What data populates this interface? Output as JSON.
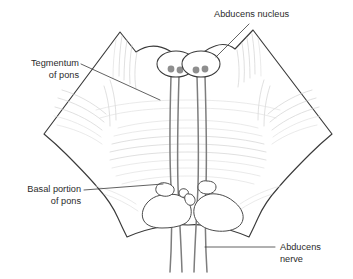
{
  "figure": {
    "background_color": "#ffffff",
    "outline_color": "#3a3a3a",
    "fiber_color": "#7d7d7d",
    "nucleus_dot_color": "#8e8e8e",
    "striation_color": "#cfcfcf",
    "text_color": "#2b2b2b"
  },
  "labels": {
    "abducens_nucleus": {
      "line1": "Abducens nucleus",
      "line2": ""
    },
    "tegmentum_of_pons": {
      "line1": "Tegmentum",
      "line2": "of pons"
    },
    "basal_portion_of_pons": {
      "line1": "Basal portion",
      "line2": "of pons"
    },
    "abducens_nerve": {
      "line1": "Abducens",
      "line2": "nerve"
    }
  },
  "structures": {
    "pons_outline": "pons-cross-section-outline",
    "left_nucleus": "left-abducens-nucleus",
    "right_nucleus": "right-abducens-nucleus",
    "left_nerve": "left-abducens-nerve",
    "right_nerve": "right-abducens-nerve",
    "left_basal_blob": "left-basal-pons-nuclei",
    "right_basal_blob": "right-basal-pons-nuclei"
  }
}
